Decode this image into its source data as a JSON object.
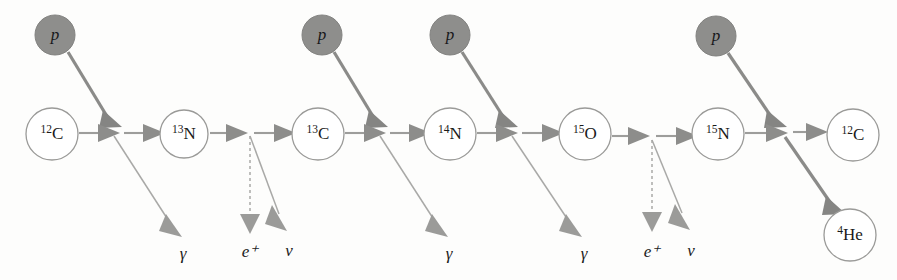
{
  "diagram": {
    "background_color": "#fdfdfc",
    "accent_gray": "#8e8e8c",
    "line_gray": "#9d9d9b",
    "circle_stroke": "#9a9a98",
    "proton_label": "p",
    "nuclides": [
      {
        "id": "c12-start",
        "mass": "12",
        "element": "C",
        "cx": 52,
        "cy": 134,
        "r": 26
      },
      {
        "id": "n13",
        "mass": "13",
        "element": "N",
        "cx": 184,
        "cy": 134,
        "r": 24
      },
      {
        "id": "c13",
        "mass": "13",
        "element": "C",
        "cx": 318,
        "cy": 134,
        "r": 26
      },
      {
        "id": "n14",
        "mass": "14",
        "element": "N",
        "cx": 450,
        "cy": 134,
        "r": 26
      },
      {
        "id": "o15",
        "mass": "15",
        "element": "O",
        "cx": 585,
        "cy": 134,
        "r": 26
      },
      {
        "id": "n15",
        "mass": "15",
        "element": "N",
        "cx": 718,
        "cy": 134,
        "r": 26
      },
      {
        "id": "c12-end",
        "mass": "12",
        "element": "C",
        "cx": 853,
        "cy": 135,
        "r": 26
      },
      {
        "id": "he4",
        "mass": "4",
        "element": "He",
        "cx": 850,
        "cy": 235,
        "r": 26
      }
    ],
    "protons": [
      {
        "id": "p1",
        "cx": 55,
        "cy": 35,
        "r": 20
      },
      {
        "id": "p2",
        "cx": 322,
        "cy": 35,
        "r": 20
      },
      {
        "id": "p3",
        "cx": 450,
        "cy": 35,
        "r": 20
      },
      {
        "id": "p4",
        "cx": 716,
        "cy": 36,
        "r": 20
      }
    ],
    "emissions": [
      {
        "id": "gamma1",
        "symbol": "γ",
        "x": 183,
        "y": 255
      },
      {
        "id": "positron1",
        "symbol": "e⁺",
        "x": 250,
        "y": 253
      },
      {
        "id": "neutrino1",
        "symbol": "ν",
        "x": 289,
        "y": 252
      },
      {
        "id": "gamma2",
        "symbol": "γ",
        "x": 449,
        "y": 255
      },
      {
        "id": "gamma3",
        "symbol": "γ",
        "x": 584,
        "y": 255
      },
      {
        "id": "positron2",
        "symbol": "e⁺",
        "x": 652,
        "y": 253
      },
      {
        "id": "neutrino2",
        "symbol": "ν",
        "x": 691,
        "y": 252
      }
    ],
    "reaction_steps": [
      {
        "step": 1,
        "input": "12C",
        "captures": "p",
        "output": "13N",
        "emits": "γ"
      },
      {
        "step": 2,
        "input": "13N",
        "captures": "",
        "output": "13C",
        "emits": "e⁺, ν"
      },
      {
        "step": 3,
        "input": "13C",
        "captures": "p",
        "output": "14N",
        "emits": "γ"
      },
      {
        "step": 4,
        "input": "14N",
        "captures": "p",
        "output": "15O",
        "emits": "γ"
      },
      {
        "step": 5,
        "input": "15O",
        "captures": "",
        "output": "15N",
        "emits": "e⁺, ν"
      },
      {
        "step": 6,
        "input": "15N",
        "captures": "p",
        "output": "12C",
        "emits": "4He"
      }
    ]
  }
}
